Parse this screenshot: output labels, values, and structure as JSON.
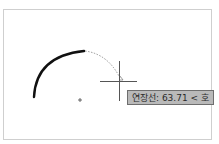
{
  "drawing": {
    "command": "arc-extension",
    "arc_center_marker": "center-point-icon",
    "cursor": "crosshair-icon",
    "colors": {
      "arc_solid": "#111111",
      "arc_preview": "#888888",
      "crosshair": "#555555",
      "tooltip_bg": "#b9b9b9",
      "tooltip_border": "#6e6e6e"
    }
  },
  "tooltip": {
    "label": "연장선: 63.71 < 호"
  }
}
